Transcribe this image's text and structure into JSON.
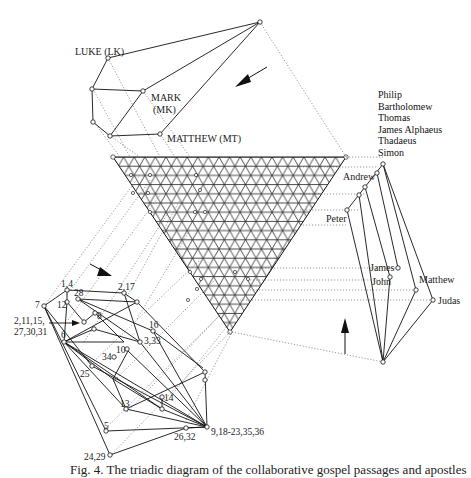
{
  "diagram": {
    "type": "triadic-diagram",
    "gospels_hierarchy": {
      "labels": [
        "LUKE (LK)",
        "MARK",
        "(MK)",
        "MATTHEW (MT)"
      ]
    },
    "apostles_hierarchy": {
      "top_list": [
        "Philip",
        "Bartholomew",
        "Thomas",
        "James Alphaeus",
        "Thadaeus",
        "Simon"
      ],
      "labels": [
        "Andrew",
        "Peter",
        "James",
        "John",
        "Matthew",
        "Judas"
      ]
    },
    "passages_hierarchy": {
      "labels": [
        "1,4",
        "2,17",
        "28",
        "7",
        "12",
        "8",
        "2,11,15,",
        "27,30,31",
        "6",
        "16",
        "3,33",
        "10",
        "34",
        "25",
        "14",
        "13",
        "9,18-23,35,36",
        "5",
        "26,32",
        "24,29"
      ]
    },
    "caption": "Fig. 4. The triadic diagram of the collaborative gospel passages and apostles"
  }
}
